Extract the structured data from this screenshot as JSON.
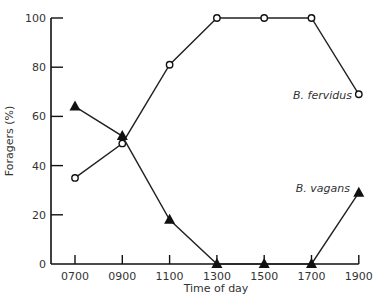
{
  "chart_data": {
    "type": "line",
    "title": "",
    "xlabel": "Time of day",
    "ylabel": "Foragers (%)",
    "categories": [
      "0700",
      "0900",
      "1100",
      "1300",
      "1500",
      "1700",
      "1900"
    ],
    "yticks": [
      "0",
      "20",
      "40",
      "60",
      "80",
      "100"
    ],
    "ylim": [
      0,
      100
    ],
    "grid": false,
    "legend": "inline labels near series ends",
    "series": [
      {
        "name": "B. fervidus",
        "marker": "open-circle",
        "values": [
          35,
          49,
          81,
          100,
          100,
          100,
          69
        ]
      },
      {
        "name": "B. vagans",
        "marker": "filled-triangle",
        "values": [
          64,
          52,
          18,
          0,
          0,
          0,
          29
        ]
      }
    ]
  }
}
